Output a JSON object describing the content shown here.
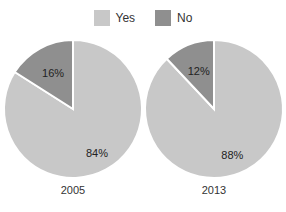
{
  "chart_data": {
    "type": "pie",
    "legend": [
      {
        "label": "Yes",
        "color": "#c8c8c8"
      },
      {
        "label": "No",
        "color": "#8f8f8f"
      }
    ],
    "legend_position": "top",
    "pies": [
      {
        "title": "2005",
        "slices": [
          {
            "label": "Yes",
            "value": 84,
            "text": "84%"
          },
          {
            "label": "No",
            "value": 16,
            "text": "16%"
          }
        ]
      },
      {
        "title": "2013",
        "slices": [
          {
            "label": "Yes",
            "value": 88,
            "text": "88%"
          },
          {
            "label": "No",
            "value": 12,
            "text": "12%"
          }
        ]
      }
    ]
  }
}
